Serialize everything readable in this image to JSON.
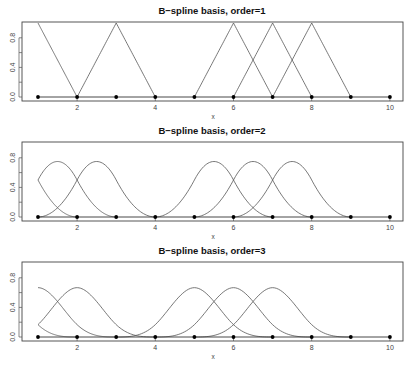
{
  "chart_data": [
    {
      "type": "line",
      "title": "B−spline basis, order=1",
      "xlabel": "x",
      "ylabel": "",
      "xlim": [
        1,
        10
      ],
      "ylim": [
        0,
        1
      ],
      "x_ticks": [
        2,
        4,
        6,
        8,
        10
      ],
      "y_ticks": [
        "0.0",
        "0.4",
        "0.8"
      ],
      "knots": [
        1,
        2,
        3,
        4,
        5,
        6,
        7,
        8,
        9,
        10
      ],
      "grid": false,
      "basis_centers": [
        1,
        3,
        6,
        7,
        8
      ],
      "series": [
        {
          "name": "B(c=1)",
          "x": [
            1,
            2
          ],
          "values": [
            1,
            0
          ]
        },
        {
          "name": "B(c=3)",
          "x": [
            2,
            3,
            4
          ],
          "values": [
            0,
            1,
            0
          ]
        },
        {
          "name": "B(c=6)",
          "x": [
            5,
            6,
            7
          ],
          "values": [
            0,
            1,
            0
          ]
        },
        {
          "name": "B(c=7)",
          "x": [
            6,
            7,
            8
          ],
          "values": [
            0,
            1,
            0
          ]
        },
        {
          "name": "B(c=8)",
          "x": [
            7,
            8,
            9
          ],
          "values": [
            0,
            1,
            0
          ]
        }
      ]
    },
    {
      "type": "line",
      "title": "B−spline basis, order=2",
      "xlabel": "x",
      "ylabel": "",
      "xlim": [
        1,
        10
      ],
      "ylim": [
        0,
        1
      ],
      "x_ticks": [
        2,
        4,
        6,
        8,
        10
      ],
      "y_ticks": [
        "0.0",
        "0.4",
        "0.8"
      ],
      "knots": [
        1,
        2,
        3,
        4,
        5,
        6,
        7,
        8,
        9,
        10
      ],
      "grid": false,
      "basis_centers": [
        0.5,
        1.5,
        2.5,
        5.5,
        6.5,
        7.5
      ],
      "peak_value": 0.75,
      "series": [
        {
          "name": "B(c=0.5)",
          "x": [
            1,
            1.5,
            2
          ],
          "values": [
            0.5,
            0.125,
            0
          ]
        },
        {
          "name": "B(c=1.5)",
          "x": [
            1,
            1.5,
            2
          ],
          "values": [
            0.5,
            0.75,
            0.5
          ]
        },
        {
          "name": "B(c=2.5)",
          "x": [
            1,
            2,
            2.5,
            3,
            4
          ],
          "values": [
            0,
            0.5,
            0.75,
            0.5,
            0
          ]
        },
        {
          "name": "B(c=5.5)",
          "x": [
            4,
            5,
            5.5,
            6,
            7
          ],
          "values": [
            0,
            0.5,
            0.75,
            0.5,
            0
          ]
        },
        {
          "name": "B(c=6.5)",
          "x": [
            5,
            6,
            6.5,
            7,
            8
          ],
          "values": [
            0,
            0.5,
            0.75,
            0.5,
            0
          ]
        },
        {
          "name": "B(c=7.5)",
          "x": [
            6,
            7,
            7.5,
            8,
            9
          ],
          "values": [
            0,
            0.5,
            0.75,
            0.5,
            0
          ]
        }
      ]
    },
    {
      "type": "line",
      "title": "B−spline basis, order=3",
      "xlabel": "x",
      "ylabel": "",
      "xlim": [
        1,
        10
      ],
      "ylim": [
        0,
        1
      ],
      "x_ticks": [
        2,
        4,
        6,
        8,
        10
      ],
      "y_ticks": [
        "0.0",
        "0.4",
        "0.8"
      ],
      "knots": [
        1,
        2,
        3,
        4,
        5,
        6,
        7,
        8,
        9,
        10
      ],
      "grid": false,
      "basis_centers": [
        0,
        1,
        2,
        5,
        6,
        7
      ],
      "peak_value": 0.667,
      "series": [
        {
          "name": "B(c=0)",
          "x": [
            1,
            2
          ],
          "values": [
            0.167,
            0
          ]
        },
        {
          "name": "B(c=1)",
          "x": [
            1,
            2,
            3
          ],
          "values": [
            0.667,
            0.167,
            0
          ]
        },
        {
          "name": "B(c=2)",
          "x": [
            1,
            2,
            3,
            4
          ],
          "values": [
            0.167,
            0.667,
            0.167,
            0
          ]
        },
        {
          "name": "B(c=5)",
          "x": [
            3,
            4,
            5,
            6,
            7
          ],
          "values": [
            0,
            0.167,
            0.667,
            0.167,
            0
          ]
        },
        {
          "name": "B(c=6)",
          "x": [
            4,
            5,
            6,
            7,
            8
          ],
          "values": [
            0,
            0.167,
            0.667,
            0.167,
            0
          ]
        },
        {
          "name": "B(c=7)",
          "x": [
            5,
            6,
            7,
            8,
            9
          ],
          "values": [
            0,
            0.167,
            0.667,
            0.167,
            0
          ]
        }
      ]
    }
  ],
  "panels": [
    {
      "title": "B−spline basis, order=1",
      "order": 1,
      "xlabel": "x"
    },
    {
      "title": "B−spline basis, order=2",
      "order": 2,
      "xlabel": "x"
    },
    {
      "title": "B−spline basis, order=3",
      "order": 3,
      "xlabel": "x"
    }
  ]
}
